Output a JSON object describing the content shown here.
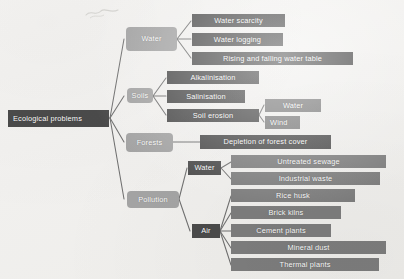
{
  "diagram": {
    "title": "Ecological problems",
    "root": {
      "label": "Ecological problems"
    },
    "branches": [
      {
        "label": "Water",
        "children": [
          {
            "label": "Water scarcity"
          },
          {
            "label": "Water logging"
          },
          {
            "label": "Rising and falling water table"
          }
        ]
      },
      {
        "label": "Soils",
        "children": [
          {
            "label": "Alkalinisation"
          },
          {
            "label": "Salinisation"
          },
          {
            "label": "Soil erosion",
            "children": [
              {
                "label": "Water"
              },
              {
                "label": "Wind"
              }
            ]
          }
        ]
      },
      {
        "label": "Forests",
        "children": [
          {
            "label": "Depletion of forest cover"
          }
        ]
      },
      {
        "label": "Pollution",
        "children": [
          {
            "label": "Water",
            "children": [
              {
                "label": "Untreated sewage"
              },
              {
                "label": "Industrial waste"
              }
            ]
          },
          {
            "label": "Air",
            "children": [
              {
                "label": "Rice husk"
              },
              {
                "label": "Brick kilns"
              },
              {
                "label": "Cement plants"
              },
              {
                "label": "Mineral dust"
              },
              {
                "label": "Thermal plants"
              }
            ]
          }
        ]
      }
    ],
    "colors": {
      "level1": "#a4a4a4",
      "leaf_dark": "#4b4b4b",
      "leaf_mid": "#7d7d7d",
      "connector": "#6f6f6f",
      "background": "#f2f1ef",
      "text": "#ffffff"
    }
  }
}
